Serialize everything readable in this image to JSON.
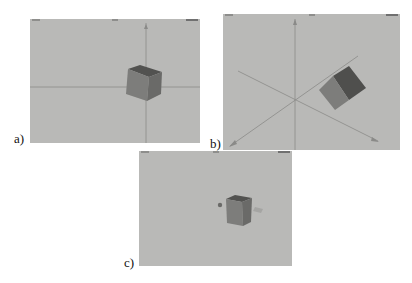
{
  "figure": {
    "panels": [
      {
        "id": "a",
        "label": "a)",
        "description": "Cube with 2D axes (horizontal x-axis, vertical y-axis)"
      },
      {
        "id": "b",
        "label": "b)",
        "description": "Cube with rotated 3D axes (x, y, z)"
      },
      {
        "id": "c",
        "label": "c)",
        "description": "Cube without axes, with small markers"
      }
    ],
    "colors": {
      "background": "#b9b9b7",
      "cube_front": "#7d7d7b",
      "cube_side": "#6a6a68",
      "cube_top": "#525250",
      "axis": "#8a8a88"
    }
  }
}
